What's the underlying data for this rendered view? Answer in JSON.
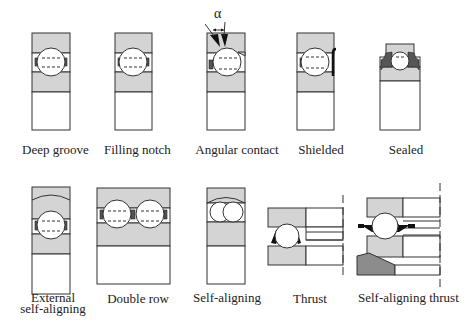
{
  "figure": {
    "colors": {
      "ring_fill": "#d4d4d4",
      "dark_fill": "#8c8c8c",
      "stroke": "#333333",
      "black": "#111111",
      "background": "#ffffff"
    },
    "angle_symbol": "α",
    "top_row": [
      {
        "id": "deep-groove",
        "label": "Deep groove"
      },
      {
        "id": "filling-notch",
        "label": "Filling notch"
      },
      {
        "id": "angular-contact",
        "label": "Angular contact"
      },
      {
        "id": "shielded",
        "label": "Shielded"
      },
      {
        "id": "sealed",
        "label": "Sealed"
      }
    ],
    "bottom_row": [
      {
        "id": "external-self-aligning",
        "label_line1": "External",
        "label_line2": "self-aligning"
      },
      {
        "id": "double-row",
        "label": "Double row"
      },
      {
        "id": "self-aligning",
        "label": "Self-aligning"
      },
      {
        "id": "thrust",
        "label": "Thrust"
      },
      {
        "id": "self-aligning-thrust",
        "label": "Self-aligning thrust"
      }
    ]
  }
}
